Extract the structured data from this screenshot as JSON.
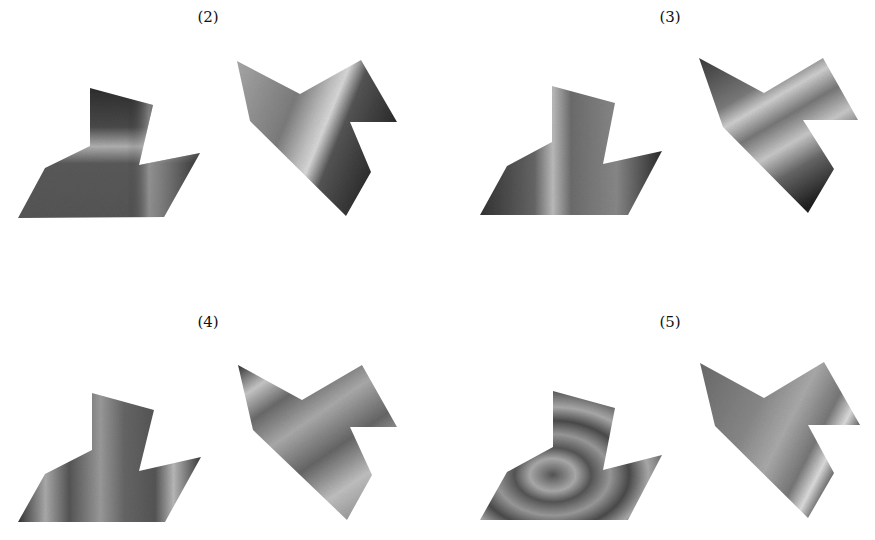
{
  "figure": {
    "panels": [
      {
        "id": "2",
        "label": "(2)",
        "label_pos": [
          208,
          8
        ]
      },
      {
        "id": "3",
        "label": "(3)",
        "label_pos": [
          670,
          8
        ]
      },
      {
        "id": "4",
        "label": "(4)",
        "label_pos": [
          208,
          313
        ]
      },
      {
        "id": "5",
        "label": "(5)",
        "label_pos": [
          670,
          313
        ]
      }
    ]
  }
}
